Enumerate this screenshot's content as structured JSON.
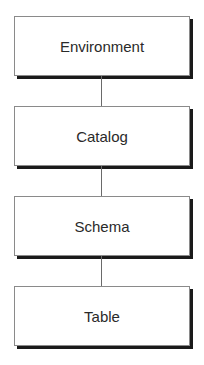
{
  "diagram": {
    "type": "hierarchy",
    "nodes": [
      {
        "label": "Environment"
      },
      {
        "label": "Catalog"
      },
      {
        "label": "Schema"
      },
      {
        "label": "Table"
      }
    ],
    "edges": [
      [
        "Environment",
        "Catalog"
      ],
      [
        "Catalog",
        "Schema"
      ],
      [
        "Schema",
        "Table"
      ]
    ]
  }
}
